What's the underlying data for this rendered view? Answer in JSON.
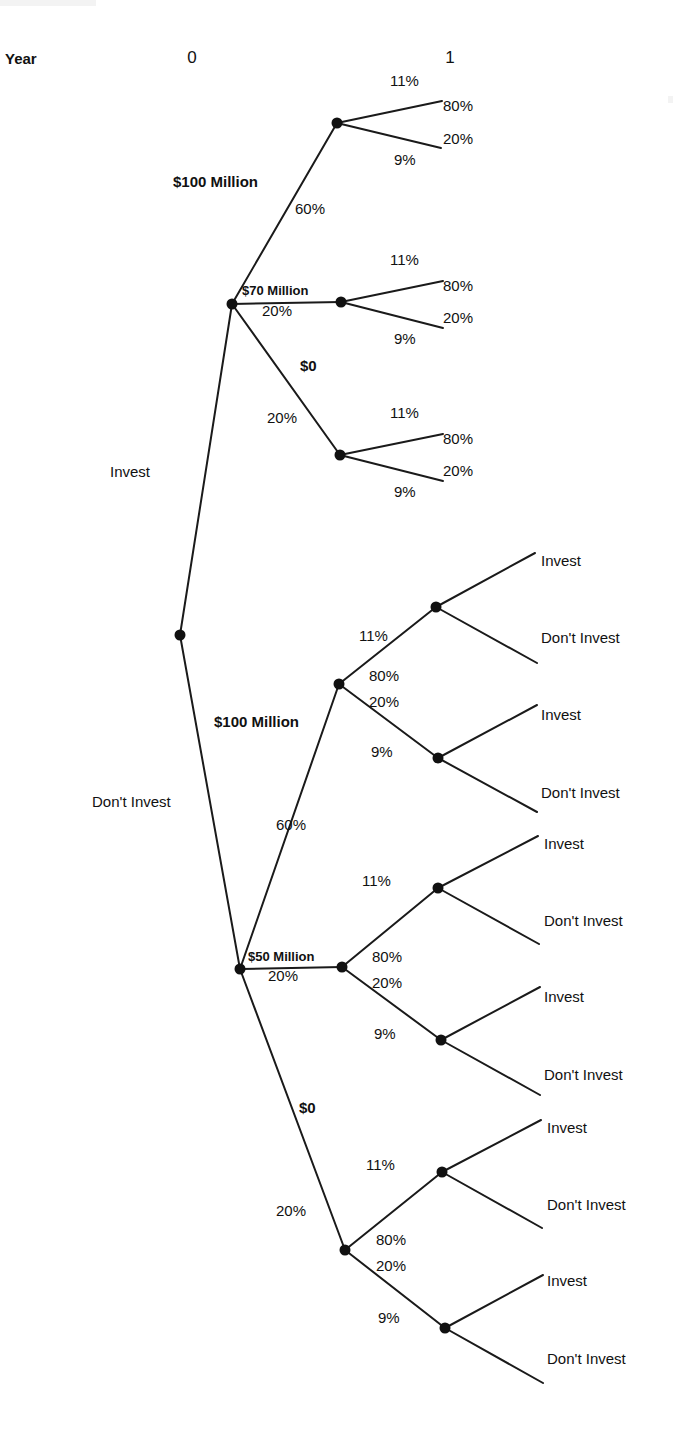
{
  "figure": {
    "type": "decision-tree",
    "header": {
      "row_label": "Year",
      "period_0": "0",
      "period_1": "1"
    },
    "root_decision": {
      "invest_label": "Invest",
      "dont_invest_label": "Don't Invest"
    },
    "invest_branch": {
      "payoff_100m": "$100 Million",
      "prob_100m": "60%",
      "payoff_70m": "$70 Million",
      "prob_70m": "20%",
      "payoff_0": "$0",
      "prob_0": "20%",
      "chance_nodes": [
        {
          "up_rate": "11%",
          "up_prob": "80%",
          "down_prob": "20%",
          "down_rate": "9%"
        },
        {
          "up_rate": "11%",
          "up_prob": "80%",
          "down_prob": "20%",
          "down_rate": "9%"
        },
        {
          "up_rate": "11%",
          "up_prob": "80%",
          "down_prob": "20%",
          "down_rate": "9%"
        }
      ]
    },
    "dont_invest_branch": {
      "payoff_100m": "$100 Million",
      "prob_100m": "60%",
      "payoff_50m": "$50 Million",
      "prob_50m": "20%",
      "payoff_0": "$0",
      "prob_0": "20%",
      "chance_nodes": [
        {
          "up_rate": "11%",
          "up_prob": "80%",
          "down_prob": "20%",
          "down_rate": "9%",
          "decisions": [
            {
              "invest": "Invest",
              "dont_invest": "Don't Invest"
            },
            {
              "invest": "Invest",
              "dont_invest": "Don't Invest"
            }
          ]
        },
        {
          "up_rate": "11%",
          "up_prob": "80%",
          "down_prob": "20%",
          "down_rate": "9%",
          "decisions": [
            {
              "invest": "Invest",
              "dont_invest": "Don't Invest"
            },
            {
              "invest": "Invest",
              "dont_invest": "Don't Invest"
            }
          ]
        },
        {
          "up_rate": "11%",
          "up_prob": "80%",
          "down_prob": "20%",
          "down_rate": "9%",
          "decisions": [
            {
              "invest": "Invest",
              "dont_invest": "Don't Invest"
            },
            {
              "invest": "Invest",
              "dont_invest": "Don't Invest"
            }
          ]
        }
      ]
    },
    "colors": {
      "line": "#1a1a1a",
      "node": "#111111",
      "text": "#111111",
      "background": "#ffffff"
    }
  }
}
